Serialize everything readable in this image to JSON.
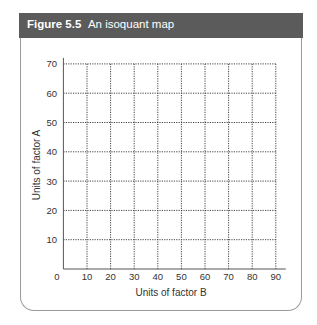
{
  "figure": {
    "number": "Figure 5.5",
    "title": "An isoquant map",
    "header_color": "#5b5b5b"
  },
  "chart_data": {
    "type": "line",
    "title": "An isoquant map",
    "xlabel": "Units of factor B",
    "ylabel": "Units of factor A",
    "x_ticks": [
      0,
      10,
      20,
      30,
      40,
      50,
      60,
      70,
      80,
      90
    ],
    "y_ticks": [
      10,
      20,
      30,
      40,
      50,
      60,
      70
    ],
    "xlim": [
      0,
      90
    ],
    "ylim": [
      0,
      70
    ],
    "grid": "dotted",
    "series": []
  }
}
